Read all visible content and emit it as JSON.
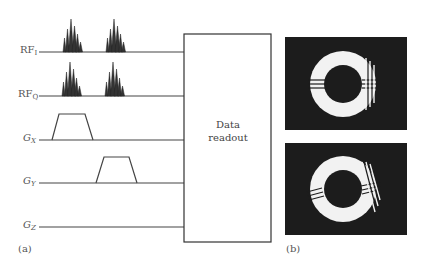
{
  "diagram": {
    "panel_a": {
      "label": "(a)",
      "channels": [
        {
          "id": "rf_i",
          "base": "RF",
          "sub": "I",
          "italic": false,
          "y": 52,
          "type": "rf"
        },
        {
          "id": "rf_q",
          "base": "RF",
          "sub": "Q",
          "italic": false,
          "y": 96,
          "type": "rf"
        },
        {
          "id": "g_x",
          "base": "G",
          "sub": "X",
          "italic": true,
          "y": 140,
          "type": "gradient"
        },
        {
          "id": "g_y",
          "base": "G",
          "sub": "Y",
          "italic": true,
          "y": 183,
          "type": "gradient"
        },
        {
          "id": "g_z",
          "base": "G",
          "sub": "Z",
          "italic": true,
          "y": 227,
          "type": "none"
        }
      ],
      "readout_box": {
        "line1": "Data",
        "line2": "readout"
      }
    },
    "panel_b": {
      "label": "(b)",
      "images": [
        "top-ring-image",
        "bottom-ring-image"
      ]
    },
    "colors": {
      "line": "#444444",
      "image_bg": "#1c1c1c",
      "ring": "#f2f2f2"
    }
  }
}
